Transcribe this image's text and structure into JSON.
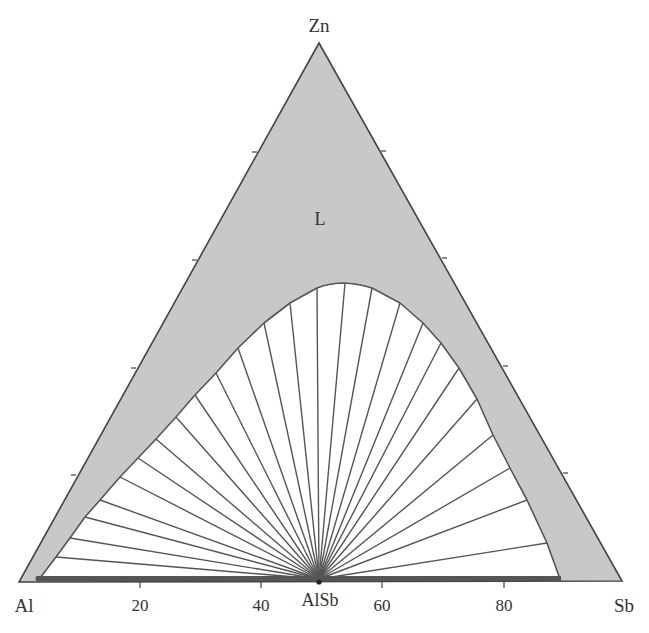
{
  "chart_data": {
    "type": "ternary-phase-diagram",
    "title": "",
    "system": "Al-Sb-Zn",
    "vertices": {
      "top": "Zn",
      "left": "Al",
      "right": "Sb"
    },
    "base_axis": {
      "ticks": [
        20,
        40,
        60,
        80
      ],
      "unit": "at.%",
      "special_point": "AlSb",
      "special_point_position": 50
    },
    "side_ticks": [
      20,
      40,
      60,
      80
    ],
    "regions": [
      {
        "name": "L",
        "label": "L",
        "fill": "#c8c8c8",
        "description": "Single-phase liquid region"
      },
      {
        "name": "L+AlSb",
        "label": "",
        "fill": "#ffffff",
        "description": "Two-phase liquid + AlSb region with tie lines converging at AlSb"
      }
    ],
    "tie_line_count": 29,
    "liquidus_boundary_points_px": [
      [
        40,
        578
      ],
      [
        56,
        557
      ],
      [
        70,
        538
      ],
      [
        85,
        517
      ],
      [
        100,
        500
      ],
      [
        120,
        477
      ],
      [
        138,
        458
      ],
      [
        156,
        439
      ],
      [
        176,
        417
      ],
      [
        195,
        395
      ],
      [
        216,
        373
      ],
      [
        238,
        348
      ],
      [
        264,
        323
      ],
      [
        290,
        303
      ],
      [
        317,
        288
      ],
      [
        345,
        283
      ],
      [
        372,
        288
      ],
      [
        400,
        303
      ],
      [
        423,
        323
      ],
      [
        441,
        343
      ],
      [
        459,
        368
      ],
      [
        477,
        399
      ],
      [
        493,
        435
      ],
      [
        510,
        468
      ],
      [
        527,
        500
      ],
      [
        547,
        543
      ],
      [
        560,
        578
      ]
    ]
  },
  "labels": {
    "zn": "Zn",
    "al": "Al",
    "sb": "Sb",
    "alsb": "AlSb",
    "region_l": "L",
    "tick_20": "20",
    "tick_40": "40",
    "tick_60": "60",
    "tick_80": "80"
  },
  "colors": {
    "liquid_fill": "#c8c8c8",
    "outline": "#444444",
    "base_bar": "#555555"
  }
}
